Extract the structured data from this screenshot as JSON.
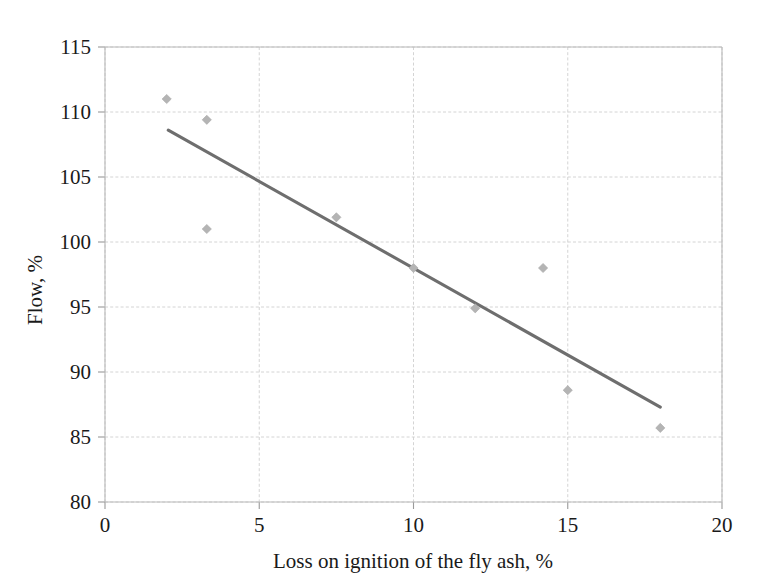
{
  "chart_data": {
    "type": "scatter",
    "title": "",
    "xlabel": "Loss on ignition of the fly ash, %",
    "ylabel": "Flow, %",
    "xlim": [
      0,
      20
    ],
    "ylim": [
      80,
      115
    ],
    "xticks": [
      "0",
      "5",
      "10",
      "15",
      "20"
    ],
    "xtick_values": [
      0,
      5,
      10,
      15,
      20
    ],
    "yticks": [
      "80",
      "85",
      "90",
      "95",
      "100",
      "105",
      "110",
      "115"
    ],
    "ytick_values": [
      80,
      85,
      90,
      95,
      100,
      105,
      110,
      115
    ],
    "grid": true,
    "legend": "none",
    "marker_shape": "diamond",
    "marker_color": "#b4b4b4",
    "trendline_color": "#6e6e6e",
    "gridline_color": "#cfcfcf",
    "axis_color": "#b9b9b9",
    "series": [
      {
        "name": "Flow vs loss on ignition",
        "points": [
          {
            "x": 2.0,
            "y": 111.0
          },
          {
            "x": 3.3,
            "y": 109.4
          },
          {
            "x": 3.3,
            "y": 101.0
          },
          {
            "x": 7.5,
            "y": 101.9
          },
          {
            "x": 10.0,
            "y": 98.0
          },
          {
            "x": 12.0,
            "y": 94.9
          },
          {
            "x": 14.2,
            "y": 98.0
          },
          {
            "x": 15.0,
            "y": 88.6
          },
          {
            "x": 18.0,
            "y": 85.7
          }
        ]
      }
    ],
    "trendline": {
      "name": "linear fit",
      "x_start": 2.05,
      "y_start": 108.6,
      "x_end": 18.0,
      "y_end": 87.3
    }
  }
}
